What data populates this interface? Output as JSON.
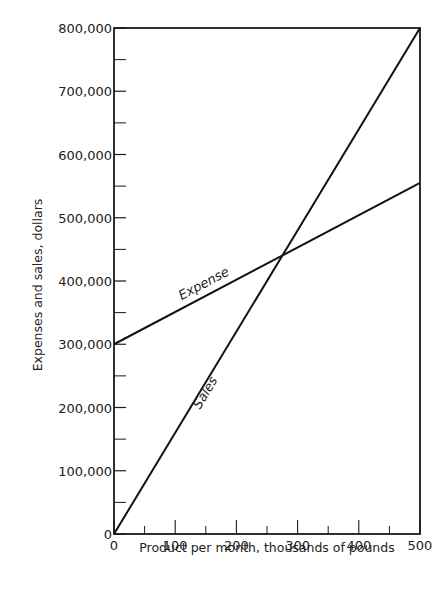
{
  "chart_data": {
    "type": "line",
    "title": "",
    "xlabel": "Product per month, thousands of pounds",
    "ylabel": "Expenses and sales, dollars",
    "xlim": [
      0,
      500
    ],
    "ylim": [
      0,
      800000
    ],
    "grid": false,
    "legend": "inline labels on lines",
    "x_ticks": [
      0,
      100,
      200,
      300,
      400,
      500
    ],
    "x_tick_labels": [
      "0",
      "100",
      "200",
      "300",
      "400",
      "500"
    ],
    "x_minor_ticks": [
      50,
      150,
      250,
      350,
      450
    ],
    "y_ticks": [
      0,
      100000,
      200000,
      300000,
      400000,
      500000,
      600000,
      700000,
      800000
    ],
    "y_tick_labels": [
      "0",
      "100,000",
      "200,000",
      "300,000",
      "400,000",
      "500,000",
      "600,000",
      "700,000",
      "800,000"
    ],
    "y_minor_ticks": [
      50000,
      150000,
      250000,
      350000,
      450000,
      550000,
      650000,
      750000
    ],
    "series": [
      {
        "name": "Expense",
        "x": [
          0,
          500
        ],
        "values": [
          300000,
          555000
        ]
      },
      {
        "name": "Sales",
        "x": [
          0,
          500
        ],
        "values": [
          0,
          800000
        ]
      }
    ],
    "annotations": [
      {
        "text": "Expense",
        "near_x": 150,
        "near_y": 390000
      },
      {
        "text": "Sales",
        "near_x": 155,
        "near_y": 220000
      }
    ],
    "break_even_point": {
      "x": 280,
      "y": 443000
    }
  }
}
